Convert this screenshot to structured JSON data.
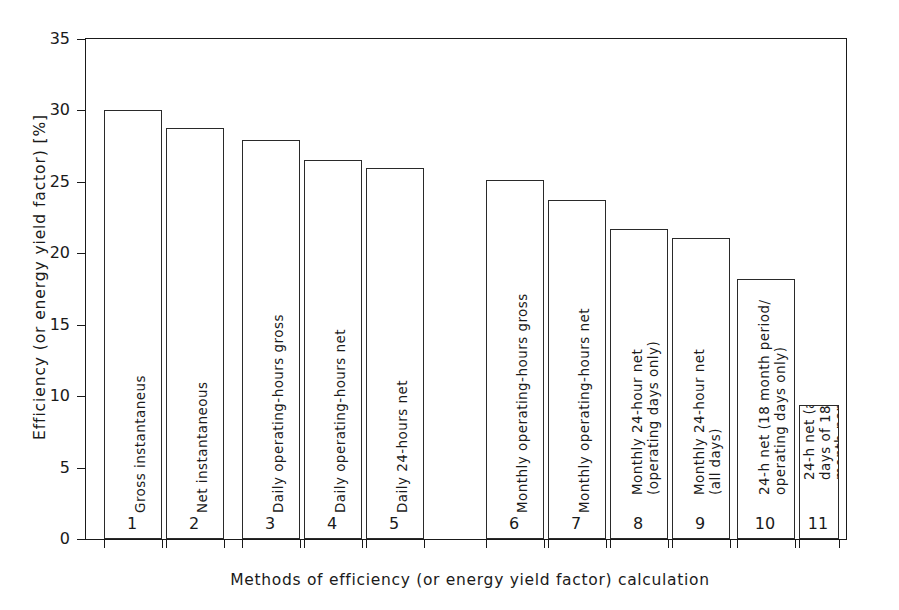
{
  "chart_data": {
    "type": "bar",
    "title": "",
    "xlabel": "Methods of efficiency (or energy yield factor) calculation",
    "ylabel": "Efficiency (or energy yield factor) [%]",
    "ylim": [
      0,
      35
    ],
    "yticks": [
      0,
      5,
      10,
      15,
      20,
      25,
      30,
      35
    ],
    "grid": false,
    "legend": "none",
    "categories": [
      "1",
      "2",
      "3",
      "4",
      "5",
      "6",
      "7",
      "8",
      "9",
      "10",
      "11"
    ],
    "values": [
      30.0,
      28.8,
      27.9,
      26.5,
      26.0,
      25.1,
      23.7,
      21.7,
      21.1,
      18.2,
      9.4
    ],
    "bar_labels": [
      "Gross instantaneus",
      "Net instantaneous",
      "Daily operating-hours gross",
      "Daily operating-hours net",
      "Daily 24-hours net",
      "Monthly operating-hours gross",
      "Monthly operating-hours net",
      "Monthly 24-hour net\n(operating days only)",
      "Monthly 24-hour net\n(all days)",
      "24-h net (18 month period/\noperating days only)",
      "24-h net (all\ndays of 18\nmonth period)"
    ]
  },
  "bars": [
    {
      "n": "1",
      "value": 30.0,
      "lines": [
        "Gross instantaneus"
      ]
    },
    {
      "n": "2",
      "value": 28.8,
      "lines": [
        "Net instantaneous"
      ]
    },
    {
      "n": "3",
      "value": 27.9,
      "lines": [
        "Daily operating-hours gross"
      ]
    },
    {
      "n": "4",
      "value": 26.5,
      "lines": [
        "Daily operating-hours net"
      ]
    },
    {
      "n": "5",
      "value": 26.0,
      "lines": [
        "Daily 24-hours net"
      ]
    },
    {
      "n": "6",
      "value": 25.1,
      "lines": [
        "Monthly operating-hours gross"
      ]
    },
    {
      "n": "7",
      "value": 23.7,
      "lines": [
        "Monthly operating-hours net"
      ]
    },
    {
      "n": "8",
      "value": 21.7,
      "lines": [
        "Monthly 24-hour net",
        "(operating days only)"
      ]
    },
    {
      "n": "9",
      "value": 21.1,
      "lines": [
        "Monthly 24-hour net",
        "(all days)"
      ]
    },
    {
      "n": "10",
      "value": 18.2,
      "lines": [
        "24-h net (18 month period/",
        "operating days only)"
      ]
    },
    {
      "n": "11",
      "value": 9.4,
      "lines": [
        "24-h net (all",
        "days of 18",
        "month period)"
      ]
    }
  ],
  "yaxis": {
    "ticks": [
      "0",
      "5",
      "10",
      "15",
      "20",
      "25",
      "30",
      "35"
    ],
    "title": "Efficiency (or energy yield factor) [%]"
  },
  "xaxis": {
    "ticks": [
      "1",
      "2",
      "3",
      "4",
      "5",
      "6",
      "7",
      "8",
      "9",
      "10",
      "11"
    ],
    "title": "Methods of efficiency (or energy yield factor) calculation"
  }
}
